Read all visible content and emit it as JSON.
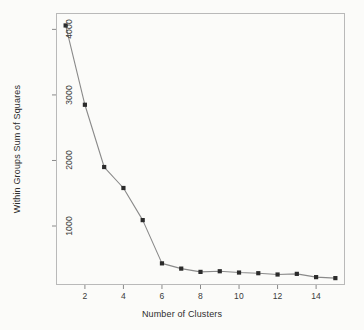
{
  "chart_data": {
    "type": "line",
    "title": "",
    "subtitle": "",
    "xlabel": "Number of Clusters",
    "ylabel": "Within Groups Sum of Squares",
    "x": [
      1,
      2,
      3,
      4,
      5,
      6,
      7,
      8,
      9,
      10,
      11,
      12,
      13,
      14,
      15
    ],
    "values": [
      4060,
      2850,
      1900,
      1580,
      1090,
      430,
      350,
      300,
      310,
      290,
      280,
      260,
      270,
      220,
      205
    ],
    "series": [
      {
        "name": "Within Groups Sum of Squares",
        "values": [
          4060,
          2850,
          1900,
          1580,
          1090,
          430,
          350,
          300,
          310,
          290,
          280,
          260,
          270,
          220,
          205
        ]
      }
    ],
    "xlim": [
      0.5,
      15.5
    ],
    "ylim": [
      100,
      4250
    ],
    "xticks": [
      2,
      4,
      6,
      8,
      10,
      12,
      14
    ],
    "xtick_labels": [
      "2",
      "4",
      "6",
      "8",
      "10",
      "12",
      "14"
    ],
    "yticks": [
      1000,
      2000,
      3000,
      4000
    ],
    "ytick_labels": [
      "1000",
      "2000",
      "3000",
      "4000"
    ],
    "grid": false,
    "legend": null,
    "legend_position": "none",
    "marker": "filled-square",
    "annotations": []
  },
  "style": {
    "background_color": "#fbfbf9",
    "frame_color": "#b9b9b9",
    "line_color": "#8a8a8a",
    "marker_color": "#2b2b2b",
    "tick_color": "#8a8a8a",
    "text_color": "#2d2d2d"
  }
}
